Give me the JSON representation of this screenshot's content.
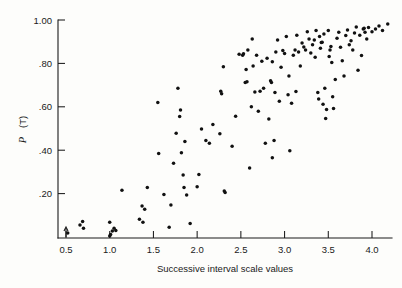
{
  "chart_data": {
    "type": "scatter",
    "title": "",
    "xlabel": "Successive interval scale values",
    "ylabel": "P (T)",
    "ylabel_italic_part": "P",
    "ylabel_rest": " (T)",
    "xlim": [
      0.33,
      4.27
    ],
    "ylim": [
      0.0,
      1.0
    ],
    "xticks": [
      0.5,
      1.0,
      1.5,
      2.0,
      2.5,
      3.0,
      3.5,
      4.0
    ],
    "xtick_labels": [
      "0.5",
      "1.0",
      "1.5",
      "2.0",
      "2.5",
      "3.0",
      "3.5",
      "4.0"
    ],
    "yticks": [
      0.2,
      0.4,
      0.6,
      0.8,
      1.0
    ],
    "ytick_labels": [
      ".20",
      ".40",
      ".60",
      ".80",
      "1.00"
    ],
    "grid": false,
    "legend": null,
    "marker": "filled-circle",
    "marker_color": "#111111",
    "background_color": "#fdfdfb",
    "axis_color": "#1a1a1a",
    "annotations": [
      {
        "name": "axis-arrow-marker",
        "x": 0.5,
        "y": 0.0,
        "shape": "upward-tick"
      }
    ],
    "points": [
      [
        0.52,
        0.018
      ],
      [
        0.66,
        0.055
      ],
      [
        0.69,
        0.072
      ],
      [
        0.7,
        0.04
      ],
      [
        1.0,
        0.005
      ],
      [
        1.01,
        0.012
      ],
      [
        1.03,
        0.028
      ],
      [
        1.05,
        0.04
      ],
      [
        1.0,
        0.068
      ],
      [
        1.07,
        0.03
      ],
      [
        1.14,
        0.215
      ],
      [
        1.34,
        0.082
      ],
      [
        1.38,
        0.068
      ],
      [
        1.37,
        0.143
      ],
      [
        1.4,
        0.128
      ],
      [
        1.43,
        0.228
      ],
      [
        1.55,
        0.62
      ],
      [
        1.56,
        0.385
      ],
      [
        1.62,
        0.196
      ],
      [
        1.68,
        0.045
      ],
      [
        1.7,
        0.148
      ],
      [
        1.73,
        0.34
      ],
      [
        1.76,
        0.478
      ],
      [
        1.78,
        0.685
      ],
      [
        1.8,
        0.555
      ],
      [
        1.81,
        0.585
      ],
      [
        1.82,
        0.388
      ],
      [
        1.84,
        0.286
      ],
      [
        1.85,
        0.228
      ],
      [
        1.86,
        0.44
      ],
      [
        1.88,
        0.194
      ],
      [
        1.92,
        0.062
      ],
      [
        2.0,
        0.232
      ],
      [
        2.02,
        0.288
      ],
      [
        2.05,
        0.498
      ],
      [
        2.1,
        0.445
      ],
      [
        2.14,
        0.432
      ],
      [
        2.18,
        0.518
      ],
      [
        2.26,
        0.476
      ],
      [
        2.28,
        0.66
      ],
      [
        2.27,
        0.672
      ],
      [
        2.3,
        0.785
      ],
      [
        2.31,
        0.212
      ],
      [
        2.32,
        0.205
      ],
      [
        2.4,
        0.418
      ],
      [
        2.44,
        0.556
      ],
      [
        2.52,
        0.838
      ],
      [
        2.53,
        0.845
      ],
      [
        2.55,
        0.712
      ],
      [
        2.57,
        0.715
      ],
      [
        2.56,
        0.772
      ],
      [
        2.58,
        0.862
      ],
      [
        2.6,
        0.318
      ],
      [
        2.62,
        0.6
      ],
      [
        2.63,
        0.912
      ],
      [
        2.64,
        0.788
      ],
      [
        2.7,
        0.58
      ],
      [
        2.72,
        0.672
      ],
      [
        2.74,
        0.81
      ],
      [
        2.76,
        0.686
      ],
      [
        2.78,
        0.432
      ],
      [
        2.8,
        0.824
      ],
      [
        2.82,
        0.544
      ],
      [
        2.84,
        0.72
      ],
      [
        2.85,
        0.712
      ],
      [
        2.86,
        0.365
      ],
      [
        2.88,
        0.445
      ],
      [
        2.89,
        0.666
      ],
      [
        2.9,
        0.852
      ],
      [
        2.92,
        0.908
      ],
      [
        2.94,
        0.626
      ],
      [
        2.96,
        0.782
      ],
      [
        2.98,
        0.86
      ],
      [
        3.0,
        0.846
      ],
      [
        3.02,
        0.924
      ],
      [
        3.04,
        0.656
      ],
      [
        3.06,
        0.398
      ],
      [
        3.08,
        0.616
      ],
      [
        3.1,
        0.838
      ],
      [
        3.12,
        0.862
      ],
      [
        3.14,
        0.93
      ],
      [
        3.16,
        0.852
      ],
      [
        3.18,
        0.788
      ],
      [
        3.2,
        0.894
      ],
      [
        3.22,
        0.876
      ],
      [
        3.24,
        0.862
      ],
      [
        3.26,
        0.946
      ],
      [
        3.28,
        0.912
      ],
      [
        3.3,
        0.848
      ],
      [
        3.32,
        0.886
      ],
      [
        3.34,
        0.908
      ],
      [
        3.36,
        0.952
      ],
      [
        3.38,
        0.666
      ],
      [
        3.39,
        0.636
      ],
      [
        3.4,
        0.924
      ],
      [
        3.41,
        0.87
      ],
      [
        3.42,
        0.896
      ],
      [
        3.43,
        0.898
      ],
      [
        3.44,
        0.612
      ],
      [
        3.45,
        0.936
      ],
      [
        3.46,
        0.686
      ],
      [
        3.47,
        0.546
      ],
      [
        3.48,
        0.588
      ],
      [
        3.5,
        0.952
      ],
      [
        3.52,
        0.862
      ],
      [
        3.53,
        0.878
      ],
      [
        3.54,
        0.804
      ],
      [
        3.55,
        0.646
      ],
      [
        3.56,
        0.592
      ],
      [
        3.58,
        0.726
      ],
      [
        3.6,
        0.916
      ],
      [
        3.62,
        0.944
      ],
      [
        3.64,
        0.874
      ],
      [
        3.66,
        0.812
      ],
      [
        3.68,
        0.742
      ],
      [
        3.7,
        0.928
      ],
      [
        3.72,
        0.954
      ],
      [
        3.74,
        0.886
      ],
      [
        3.76,
        0.904
      ],
      [
        3.78,
        0.862
      ],
      [
        3.8,
        0.94
      ],
      [
        3.82,
        0.968
      ],
      [
        3.84,
        0.768
      ],
      [
        3.86,
        0.93
      ],
      [
        3.88,
        0.836
      ],
      [
        3.9,
        0.958
      ],
      [
        3.91,
        0.962
      ],
      [
        3.92,
        0.944
      ],
      [
        3.94,
        0.912
      ],
      [
        3.96,
        0.966
      ],
      [
        4.0,
        0.946
      ],
      [
        4.04,
        0.958
      ],
      [
        4.08,
        0.972
      ],
      [
        4.12,
        0.952
      ],
      [
        4.18,
        0.982
      ],
      [
        2.66,
        0.668
      ],
      [
        2.68,
        0.838
      ],
      [
        3.05,
        0.742
      ],
      [
        3.35,
        0.828
      ],
      [
        3.51,
        0.832
      ],
      [
        2.48,
        0.842
      ],
      [
        2.86,
        0.808
      ],
      [
        3.13,
        0.67
      ]
    ]
  }
}
